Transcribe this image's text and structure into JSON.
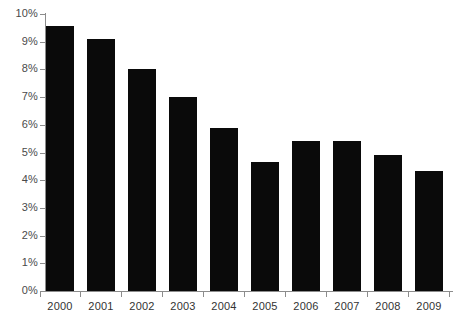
{
  "chart_data": {
    "type": "bar",
    "title": "",
    "subtitle": "",
    "xlabel": "",
    "ylabel": "",
    "categories": [
      "2000",
      "2001",
      "2002",
      "2003",
      "2004",
      "2005",
      "2006",
      "2007",
      "2008",
      "2009"
    ],
    "values": [
      9.55,
      9.1,
      8.0,
      7.0,
      5.9,
      4.65,
      5.4,
      5.4,
      4.9,
      4.35
    ],
    "series": [
      {
        "name": "",
        "values": [
          9.55,
          9.1,
          8.0,
          7.0,
          5.9,
          4.65,
          5.4,
          5.4,
          4.9,
          4.35
        ]
      }
    ],
    "ylim": [
      0,
      10
    ],
    "ytick_labels": [
      "0%",
      "1%",
      "2%",
      "3%",
      "4%",
      "5%",
      "6%",
      "7%",
      "8%",
      "9%",
      "10%"
    ],
    "ytick_values": [
      0,
      1,
      2,
      3,
      4,
      5,
      6,
      7,
      8,
      9,
      10
    ],
    "xtick_labels": [
      "2000",
      "2001",
      "2002",
      "2003",
      "2004",
      "2005",
      "2006",
      "2007",
      "2008",
      "2009"
    ],
    "grid": false,
    "legend": false,
    "legend_position": "none",
    "bar_color": "#0a0a0a",
    "axis_color": "#8c8c8c",
    "background_color": "#ffffff",
    "annotations": []
  }
}
